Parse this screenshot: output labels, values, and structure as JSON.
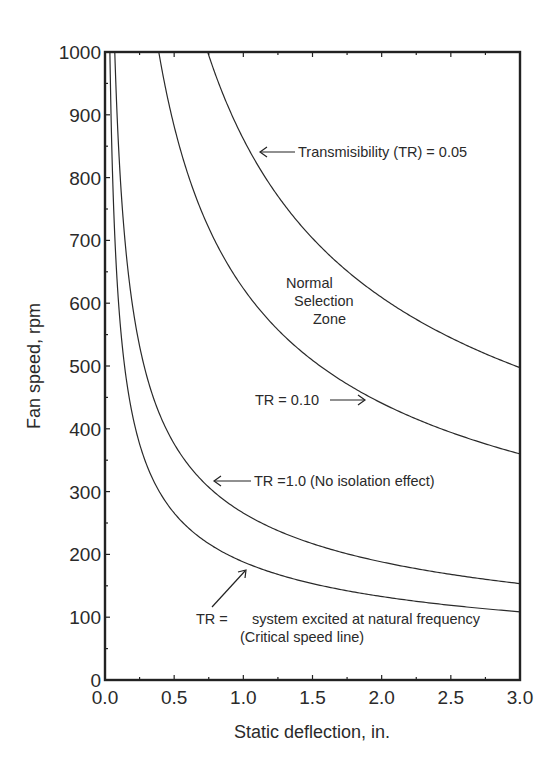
{
  "chart_data": {
    "type": "line",
    "title": "",
    "xlabel": "Static deflection, in.",
    "ylabel": "Fan speed, rpm",
    "xlim": [
      0.0,
      3.0
    ],
    "ylim": [
      0,
      1000
    ],
    "grid": false,
    "legend": "none (curves labeled by inline annotations)",
    "x_ticks": [
      "0.0",
      "0.5",
      "1.0",
      "1.5",
      "2.0",
      "2.5",
      "3.0"
    ],
    "y_ticks": [
      "0",
      "100",
      "200",
      "300",
      "400",
      "500",
      "600",
      "700",
      "800",
      "900",
      "1000"
    ],
    "x": [
      0.05,
      0.1,
      0.2,
      0.3,
      0.4,
      0.5,
      0.75,
      1.0,
      1.25,
      1.5,
      1.75,
      2.0,
      2.25,
      2.5,
      2.75,
      3.0
    ],
    "series": [
      {
        "name": "TR = system excited at natural frequency (Critical speed line)",
        "k": 188.0,
        "values": [
          841,
          595,
          420,
          343,
          297,
          266,
          217,
          188,
          168,
          154,
          142,
          133,
          125,
          119,
          113,
          109
        ]
      },
      {
        "name": "TR = 1.0 (No isolation effect)",
        "k": 265.9,
        "values": [
          null,
          841,
          595,
          485,
          420,
          376,
          307,
          266,
          238,
          217,
          201,
          188,
          177,
          168,
          160,
          154
        ]
      },
      {
        "name": "TR = 0.10",
        "k": 623.5,
        "values": [
          null,
          null,
          null,
          null,
          986,
          882,
          720,
          624,
          558,
          509,
          471,
          441,
          416,
          394,
          376,
          360
        ]
      },
      {
        "name": "Transmisibility (TR) = 0.05",
        "k": 861.5,
        "values": [
          null,
          null,
          null,
          null,
          null,
          null,
          995,
          862,
          771,
          703,
          651,
          609,
          574,
          545,
          520,
          497
        ]
      }
    ],
    "annotations": [
      {
        "text": "Transmisibility (TR) = 0.05",
        "arrow": "left"
      },
      {
        "text": "Normal Selection Zone"
      },
      {
        "text": "TR = 0.10",
        "arrow": "right"
      },
      {
        "text": "TR =1.0 (No isolation effect)",
        "arrow": "left"
      },
      {
        "text": "TR =    system excited at natural frequency",
        "line2": "(Critical speed line)",
        "arrow": "up-right"
      }
    ]
  },
  "labels": {
    "xlabel": "Static deflection, in.",
    "ylabel": "Fan speed, rpm",
    "anno_tr005": "Transmisibility (TR) = 0.05",
    "anno_zone_1": "Normal",
    "anno_zone_2": "Selection",
    "anno_zone_3": "Zone",
    "anno_tr010": "TR = 0.10",
    "anno_tr1": "TR =1.0 (No isolation effect)",
    "anno_crit_1": "TR =",
    "anno_crit_2": "system excited at natural frequency",
    "anno_crit_3": "(Critical speed line)"
  }
}
